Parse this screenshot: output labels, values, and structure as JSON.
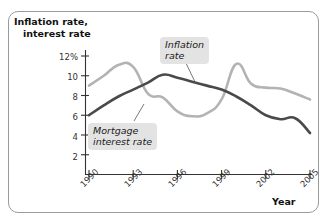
{
  "axes": {
    "y_title_line1": "Inflation rate,",
    "y_title_line2": "interest rate",
    "x_title": "Year",
    "y_ticks": [
      "12%",
      "10",
      "8",
      "6",
      "4",
      "2"
    ],
    "x_ticks": [
      "1990",
      "1993",
      "1996",
      "1999",
      "2002",
      "2005"
    ]
  },
  "annotations": {
    "inflation_line1": "Inflation",
    "inflation_line2": "rate",
    "mortgage_line1": "Mortgage",
    "mortgage_line2": "interest rate"
  },
  "colors": {
    "inflation_line": "#4a4a4a",
    "mortgage_line": "#b3b3b3",
    "callout_bg": "#e3e3e3",
    "axis": "#333333",
    "frame": "#9a9a9a"
  },
  "chart_data": {
    "type": "line",
    "title": "",
    "xlabel": "Year",
    "ylabel": "Inflation rate, interest rate",
    "xlim": [
      1990,
      2005
    ],
    "ylim": [
      0,
      13
    ],
    "grid": false,
    "legend": "annotated-callouts",
    "x": [
      1990,
      1991,
      1992,
      1993,
      1994,
      1995,
      1996,
      1997,
      1998,
      1999,
      2000,
      2001,
      2002,
      2003,
      2004,
      2005
    ],
    "series": [
      {
        "name": "Mortgage interest rate",
        "color": "#b3b3b3",
        "values": [
          9.0,
          10.0,
          11.1,
          10.9,
          8.2,
          7.8,
          6.4,
          5.9,
          6.2,
          7.6,
          11.2,
          9.2,
          8.8,
          8.7,
          8.2,
          7.6
        ]
      },
      {
        "name": "Inflation rate",
        "color": "#4a4a4a",
        "values": [
          6.0,
          7.0,
          7.9,
          8.6,
          9.3,
          10.1,
          9.8,
          9.4,
          9.0,
          8.6,
          7.9,
          7.0,
          6.0,
          5.6,
          5.7,
          4.2
        ]
      }
    ]
  }
}
